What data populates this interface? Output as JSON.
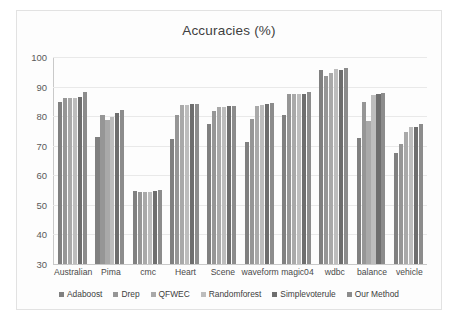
{
  "chart_data": {
    "type": "bar",
    "title": "Accuracies (%)",
    "xlabel": "",
    "ylabel": "",
    "ylim": [
      30,
      100
    ],
    "yticks": [
      100,
      90,
      80,
      70,
      60,
      50,
      40,
      30
    ],
    "grid": true,
    "legend_position": "bottom",
    "categories": [
      "Australian",
      "Pima",
      "cmc",
      "Heart",
      "Scene",
      "waveform",
      "magic04",
      "wdbc",
      "balance",
      "vehicle"
    ],
    "series": [
      {
        "name": "Adaboost",
        "color": "#808080",
        "values": [
          84.8,
          72.8,
          54.8,
          72.3,
          77.4,
          71.3,
          80.3,
          95.6,
          72.7,
          67.6
        ]
      },
      {
        "name": "Drep",
        "color": "#969696",
        "values": [
          86.0,
          80.3,
          54.3,
          80.4,
          81.6,
          79.2,
          87.6,
          93.6,
          84.9,
          70.7
        ]
      },
      {
        "name": "QFWEC",
        "color": "#a9a9a9",
        "values": [
          86.0,
          78.7,
          54.2,
          83.7,
          83.1,
          83.3,
          87.6,
          94.6,
          78.3,
          74.6
        ]
      },
      {
        "name": "Randomforest",
        "color": "#bdbdbd",
        "values": [
          86.2,
          79.6,
          54.4,
          83.9,
          83.1,
          83.8,
          87.5,
          95.8,
          87.0,
          76.2
        ]
      },
      {
        "name": "Simplevoterule",
        "color": "#6e6e6e",
        "values": [
          86.6,
          80.9,
          54.6,
          84.0,
          83.4,
          84.2,
          87.6,
          95.5,
          87.6,
          76.3
        ]
      },
      {
        "name": "Our Method",
        "color": "#8c8c8c",
        "values": [
          88.2,
          82.2,
          55.0,
          84.0,
          83.4,
          84.4,
          88.2,
          96.4,
          87.7,
          77.3
        ]
      }
    ]
  }
}
